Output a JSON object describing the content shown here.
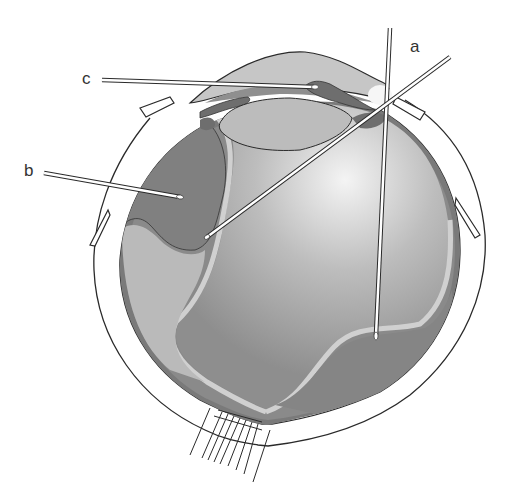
{
  "diagram": {
    "labels": [
      {
        "id": "a",
        "text": "a"
      },
      {
        "id": "b",
        "text": "b"
      },
      {
        "id": "c",
        "text": "c"
      }
    ],
    "colors": {
      "background": "#ffffff",
      "sclera": "#ffffff",
      "outline": "#2a2a2a",
      "choroid": "#7a7a7a",
      "vitreous_dark": "#8c8c8c",
      "vitreous_light": "#e8e8e8",
      "cornea": "#c4c4c4",
      "lens": "#bcbcbc",
      "iris": "#6e6e6e",
      "retina_band": "#c8c8c8"
    }
  }
}
